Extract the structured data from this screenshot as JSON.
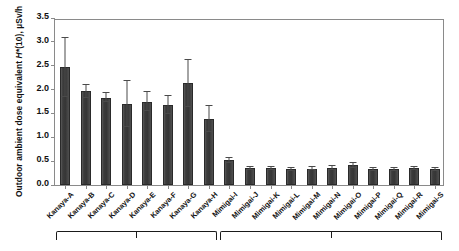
{
  "chart_data": {
    "type": "bar",
    "title": "",
    "xlabel": "",
    "ylabel": "Outdoor ambient dose equivalent H*(10), µSv/h",
    "ylabel_parts": {
      "prefix": "Outdoor ambient dose equivalent  ",
      "italic": "H*",
      "paren": "(10), µSv/h"
    },
    "ylim": [
      0.0,
      3.5
    ],
    "yticks": [
      0.0,
      0.5,
      1.0,
      1.5,
      2.0,
      2.5,
      3.0,
      3.5
    ],
    "ytick_labels": [
      "0.0",
      "0.5",
      "1.0",
      "1.5",
      "2.0",
      "2.5",
      "3.0",
      "3.5"
    ],
    "grid": false,
    "legend": "none",
    "bar_color": "#3c3c3c",
    "error_bar_color": "#4a4a4a",
    "axis_color": "#8a8a8a",
    "categories": [
      "Kanaya-A",
      "Kanaya-B",
      "Kanaya-C",
      "Kanaya-D",
      "Kanaya-E",
      "Kanaya-F",
      "Kanaya-G",
      "Kanaya-H",
      "Mimigai-I",
      "Mimigai-J",
      "Mimigai-K",
      "Mimigai-L",
      "Mimigai-M",
      "Mimigai-N",
      "Mimigai-O",
      "Mimigai-P",
      "Mimigai-Q",
      "Mimigai-R",
      "Mimigai-S"
    ],
    "values": [
      2.47,
      1.96,
      1.83,
      1.7,
      1.75,
      1.68,
      2.13,
      1.38,
      0.52,
      0.35,
      0.35,
      0.33,
      0.34,
      0.36,
      0.41,
      0.33,
      0.33,
      0.35,
      0.33
    ],
    "errors_upper": [
      0.62,
      0.13,
      0.09,
      0.48,
      0.2,
      0.19,
      0.5,
      0.27,
      0.05,
      0.03,
      0.03,
      0.03,
      0.03,
      0.04,
      0.05,
      0.03,
      0.03,
      0.03,
      0.03
    ],
    "errors_lower": [
      0.62,
      0.13,
      0.09,
      0.48,
      0.2,
      0.19,
      0.5,
      0.27,
      0.05,
      0.03,
      0.03,
      0.03,
      0.03,
      0.04,
      0.05,
      0.03,
      0.03,
      0.03,
      0.03
    ],
    "groups": [
      {
        "label": "",
        "start_index": 0,
        "end_index": 7
      },
      {
        "label": "",
        "start_index": 8,
        "end_index": 18
      }
    ]
  }
}
